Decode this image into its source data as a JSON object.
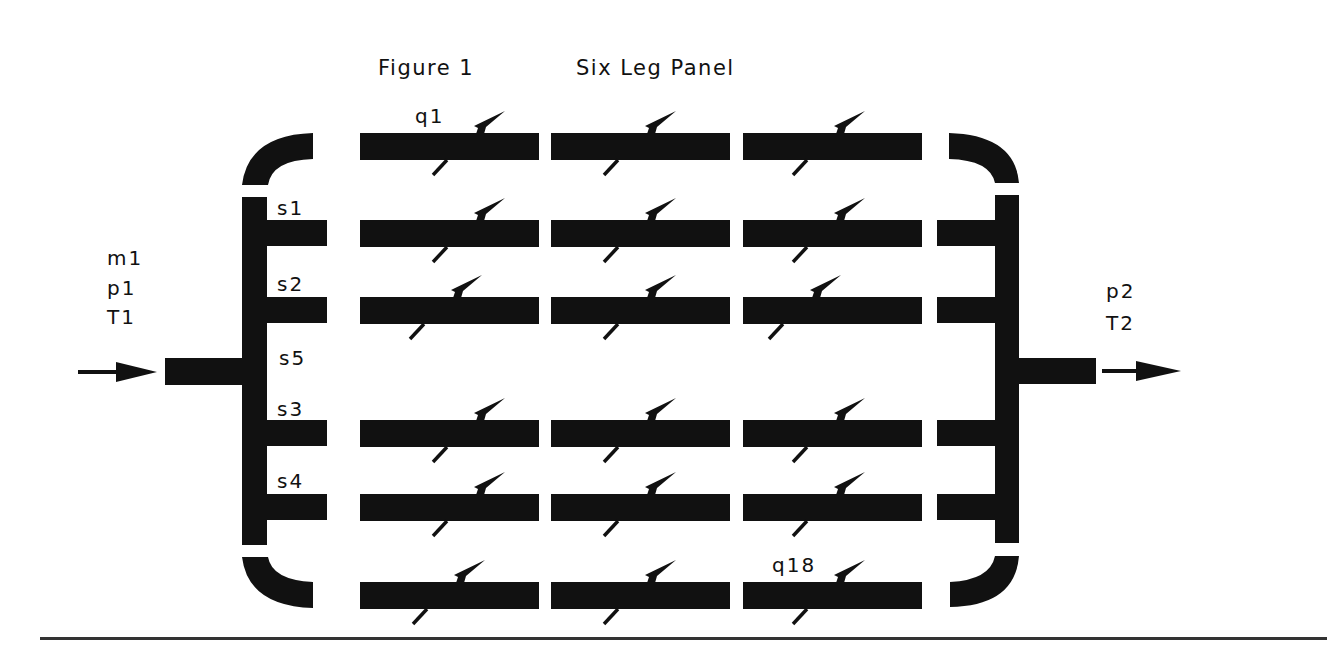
{
  "title": {
    "figure": "Figure 1",
    "name": "Six Leg Panel"
  },
  "colors": {
    "ink": "#111111",
    "background": "#ffffff",
    "rule": "#333333"
  },
  "inlet": {
    "labels": [
      "m1",
      "p1",
      "T1"
    ],
    "arrow_icon": "right-arrow"
  },
  "outlet": {
    "labels": [
      "p2",
      "T2"
    ],
    "arrow_icon": "right-arrow"
  },
  "stream_labels": {
    "s1": "s1",
    "s2": "s2",
    "s5": "s5",
    "s3": "s3",
    "s4": "s4"
  },
  "heat_flux_labels": {
    "first": "q1",
    "last": "q18"
  },
  "layout": {
    "rows_y": [
      133,
      220,
      297,
      420,
      494,
      582
    ],
    "pipe_segments_x": [
      [
        360,
        539
      ],
      [
        551,
        730
      ],
      [
        743,
        922
      ]
    ],
    "pipe_thickness": 27,
    "connected_rows": [
      1,
      2,
      3,
      4
    ],
    "arrow_offsets": [
      [
        118,
        98,
        95
      ],
      [
        118,
        98,
        95
      ],
      [
        95,
        98,
        71
      ],
      [
        118,
        98,
        95
      ],
      [
        118,
        98,
        95
      ],
      [
        98,
        98,
        95
      ]
    ]
  }
}
